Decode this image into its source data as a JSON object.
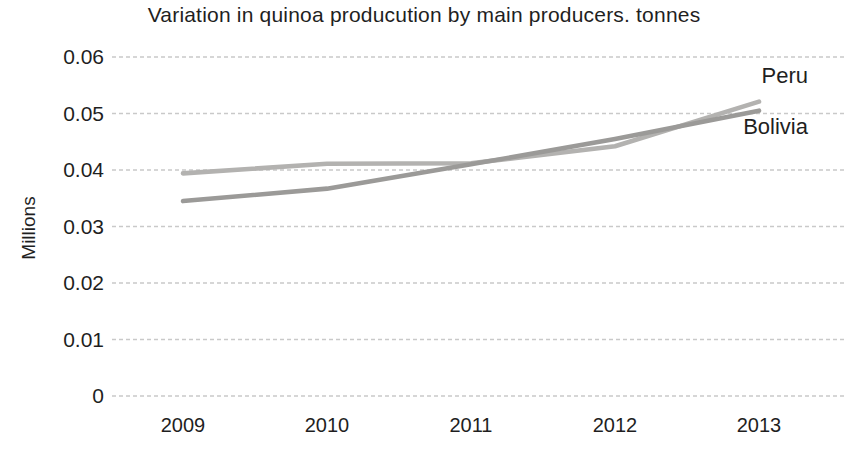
{
  "chart_data": {
    "type": "line",
    "title": "Variation in quinoa producution by main producers. tonnes",
    "ylabel": "Millions",
    "xlabel": "",
    "categories": [
      "2009",
      "2010",
      "2011",
      "2012",
      "2013"
    ],
    "series": [
      {
        "name": "Peru",
        "values": [
          0.0394,
          0.0411,
          0.0412,
          0.0442,
          0.0521
        ],
        "color": "#b3b2b0"
      },
      {
        "name": "Bolivia",
        "values": [
          0.0345,
          0.0367,
          0.041,
          0.0455,
          0.0505
        ],
        "color": "#9b9a98"
      }
    ],
    "y_ticks": [
      0,
      0.01,
      0.02,
      0.03,
      0.04,
      0.05,
      0.06
    ],
    "y_tick_labels": [
      "0",
      "0.01",
      "0.02",
      "0.03",
      "0.04",
      "0.05",
      "0.06"
    ],
    "ylim": [
      0,
      0.06
    ],
    "grid": "horizontal",
    "gridline_color": "#c9c9c9",
    "legend_position": "line-end-labels",
    "text_color": "#1f1f1f"
  }
}
